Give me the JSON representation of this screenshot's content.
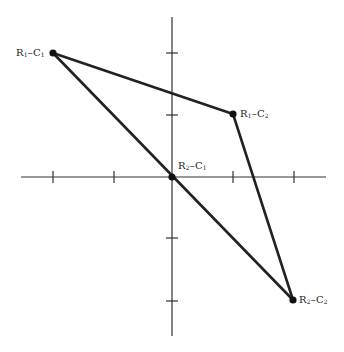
{
  "diagram": {
    "type": "coordinate-plot",
    "canvas": {
      "width": 344,
      "height": 352
    },
    "origin_px": {
      "x": 172,
      "y": 177
    },
    "unit_px": 61,
    "axes": {
      "x_range": [
        -2.45,
        2.6
      ],
      "y_range": [
        -2.6,
        2.6
      ],
      "x_ticks": [
        -2,
        -1,
        1,
        2
      ],
      "y_ticks": [
        -2,
        -1,
        1,
        2
      ],
      "tick_labels_visible": false
    },
    "points": [
      {
        "id": "r1c1",
        "row": "R",
        "row_sub": "1",
        "col": "C",
        "col_sub": "1",
        "x": -2,
        "y": 2
      },
      {
        "id": "r1c2",
        "row": "R",
        "row_sub": "1",
        "col": "C",
        "col_sub": "2",
        "x": 1,
        "y": 1
      },
      {
        "id": "r2c1",
        "row": "R",
        "row_sub": "2",
        "col": "C",
        "col_sub": "1",
        "x": 0,
        "y": 0
      },
      {
        "id": "r2c2",
        "row": "R",
        "row_sub": "2",
        "col": "C",
        "col_sub": "2",
        "x": 2,
        "y": -2
      }
    ],
    "edges": [
      [
        "r1c1",
        "r1c2"
      ],
      [
        "r1c2",
        "r2c2"
      ],
      [
        "r1c1",
        "r2c2"
      ]
    ],
    "labels": {
      "r1c1": {
        "main1": "R",
        "sub1": "1",
        "dash": "–",
        "main2": "C",
        "sub2": "1"
      },
      "r1c2": {
        "main1": "R",
        "sub1": "1",
        "dash": "–",
        "main2": "C",
        "sub2": "2"
      },
      "r2c1": {
        "main1": "R",
        "sub1": "2",
        "dash": "–",
        "main2": "C",
        "sub2": "1"
      },
      "r2c2": {
        "main1": "R",
        "sub1": "2",
        "dash": "–",
        "main2": "C",
        "sub2": "2"
      }
    },
    "colors": {
      "axis": "#333333",
      "edge": "#222222",
      "point": "#111111",
      "text": "#222222",
      "background": "#ffffff"
    }
  }
}
